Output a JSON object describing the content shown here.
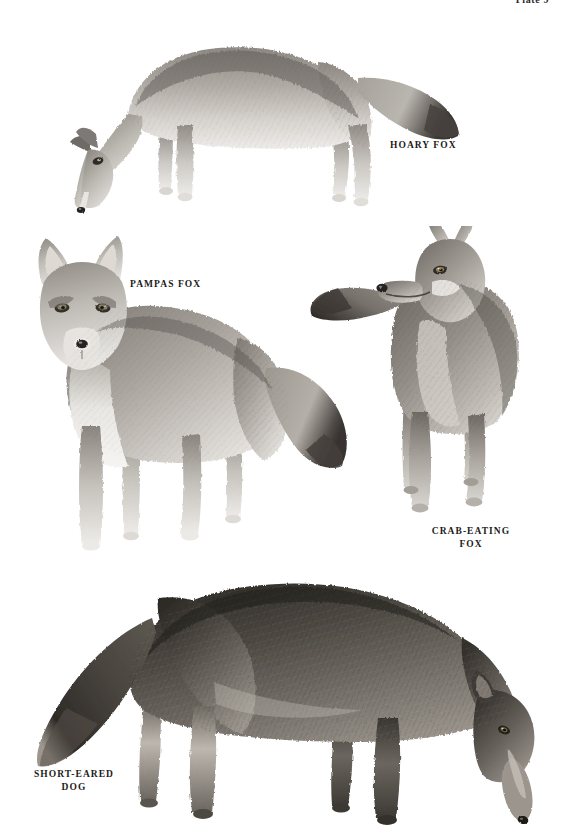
{
  "page": {
    "plate_number": "Plate 9",
    "background_color": "#ffffff",
    "width": 561,
    "height": 840,
    "medium": "graphite pencil illustration"
  },
  "figures": [
    {
      "id": "hoary-fox",
      "caption": "HOARY FOX",
      "pose": "standing in profile facing left, head lowered to ground, bushy tail extended right",
      "tone": "light grey, pale grizzled fur, dark tail tip",
      "fur_light": "#e9e7e4",
      "fur_mid": "#9c9791",
      "fur_dark": "#4a4643",
      "caption_left": 390,
      "caption_top": 139,
      "bounds": {
        "left": 32,
        "top": 22,
        "width": 430,
        "height": 196
      }
    },
    {
      "id": "pampas-fox",
      "caption": "PAMPAS FOX",
      "pose": "standing three-quarter front view facing viewer, large erect ears, long bushy tail to the right",
      "tone": "medium grey with pale throat and chest, darker dorsal band",
      "fur_light": "#efedea",
      "fur_mid": "#968f89",
      "fur_dark": "#403c39",
      "caption_left": 130,
      "caption_top": 278,
      "bounds": {
        "left": 12,
        "top": 228,
        "width": 340,
        "height": 340
      }
    },
    {
      "id": "crab-eating-fox",
      "caption": "CRAB-EATING\nFOX",
      "pose": "standing facing viewer with head turned to the left in profile, tail sweeping left",
      "tone": "dark grizzled grey-brown with pale cheek patch",
      "fur_light": "#e4e1dd",
      "fur_mid": "#85807b",
      "fur_dark": "#38342f",
      "caption_left": 424,
      "caption_top": 531,
      "bounds": {
        "left": 308,
        "top": 226,
        "width": 232,
        "height": 304
      }
    },
    {
      "id": "short-eared-dog",
      "caption": "SHORT-EARED\nDOG",
      "pose": "standing in profile facing right, head lowered sniffing ground, heavy bushy tail to the left",
      "tone": "dark charcoal grey-brown, short dense coat, pale muzzle and inner legs",
      "fur_light": "#cfcbc6",
      "fur_mid": "#6a655f",
      "fur_dark": "#2a2724",
      "caption_left": 14,
      "caption_top": 768,
      "bounds": {
        "left": 18,
        "top": 562,
        "width": 537,
        "height": 278
      }
    }
  ]
}
